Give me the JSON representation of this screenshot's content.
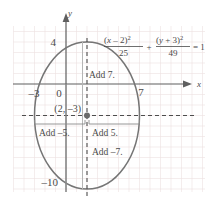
{
  "figure": {
    "name": "ellipse-translation-graph",
    "axes": {
      "x_axis_label": "x",
      "y_axis_label": "y",
      "x_ticks": [
        {
          "value": -3,
          "label": "–3"
        },
        {
          "value": 7,
          "label": "7"
        }
      ],
      "y_ticks": [
        {
          "value": 4,
          "label": "4"
        },
        {
          "value": -10,
          "label": "–10"
        }
      ],
      "origin_label": "0"
    },
    "equation": {
      "num1_open": "(",
      "num1_var": "x",
      "num1_op": " – 2",
      "num1_close": ")",
      "num1_exp": "2",
      "den1": "25",
      "plus": "+",
      "num2_open": "(",
      "num2_var": "y",
      "num2_op": " + 3",
      "num2_close": ")",
      "num2_exp": "2",
      "den2": "49",
      "equals": "= 1",
      "full_text": "(x – 2)²/25 + (y + 3)²/49 = 1"
    },
    "center_point": {
      "label": "(2, –3)",
      "x": 2,
      "y": -3
    },
    "annotations": [
      {
        "id": "add-7",
        "label": "Add 7."
      },
      {
        "id": "add-neg-5",
        "label": "Add –5."
      },
      {
        "id": "add-5",
        "label": "Add 5."
      },
      {
        "id": "add-neg-7",
        "label": "Add –7."
      }
    ],
    "colors": {
      "curve": "#6e6e6e",
      "axis": "#5a5a5a",
      "grid": "#e9dcdc",
      "grid_major": "#e0d2d2",
      "dashed": "#555555",
      "text": "#4a4a4a",
      "background": "#ffffff"
    },
    "ellipse": {
      "center_x": 2,
      "center_y": -3,
      "semi_axis_x": 5,
      "semi_axis_y": 7,
      "x_range": [
        -3,
        7
      ],
      "y_range": [
        -10,
        4
      ]
    }
  }
}
